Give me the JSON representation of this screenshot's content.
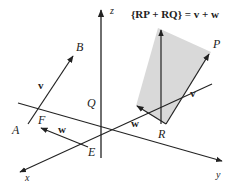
{
  "figure": {
    "formula": "{RP + RQ} = v + w",
    "axes": {
      "x": "x",
      "y": "y",
      "z": "z"
    },
    "points": {
      "A": "A",
      "B": "B",
      "E": "E",
      "F": "F",
      "P": "P",
      "Q": "Q",
      "R": "R"
    },
    "vectors": {
      "v_left": "v",
      "w_left": "w",
      "v_right": "v",
      "w_right": "w"
    },
    "colors": {
      "line": "#222222",
      "parallelogram_fill": "#d9d9d9",
      "background": "#ffffff"
    }
  }
}
